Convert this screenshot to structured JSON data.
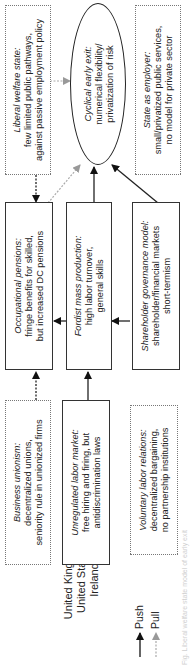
{
  "legend": {
    "countries": [
      "United Kingdom",
      "United States",
      "Ireland"
    ],
    "push_label": "Push",
    "pull_label": "Pull",
    "push_color": "#111111",
    "pull_color": "#999999"
  },
  "boxes": {
    "business_unionism": {
      "title": "Business unionism:",
      "lines": [
        "decentralized unions,",
        "seniority rule in unionized firms"
      ],
      "border": "dotted"
    },
    "unregulated_labor_market": {
      "title": "Unregulated labor market:",
      "lines": [
        "free hiring and firing, but",
        "antidiscrimination laws"
      ],
      "border": "solid"
    },
    "voluntary_labor_relations": {
      "title": "Voluntary labor relations:",
      "lines": [
        "decentralized bargaining,",
        "no partnership institutions"
      ],
      "border": "dotted"
    },
    "occupational_pensions": {
      "title": "Occupational pensions:",
      "lines": [
        "fringe benefits for skilled,",
        "but increased DC pensions"
      ],
      "border": "solid"
    },
    "fordist_mass_production": {
      "title": "Fordist mass production:",
      "lines": [
        "high labor turnover,",
        "general skills"
      ],
      "border": "solid"
    },
    "shareholder_governance": {
      "title": "Shareholder governance model:",
      "lines": [
        "shareholder/financial markets",
        "short-termism"
      ],
      "border": "solid"
    },
    "liberal_welfare_state": {
      "title": "Liberal welfare state:",
      "lines": [
        "few limited public pathways,",
        "against passive employment policy"
      ],
      "border": "dotted"
    },
    "state_as_employer": {
      "title": "State as employer:",
      "lines": [
        "small/privatized public services,",
        "no model for private sector"
      ],
      "border": "dotted"
    }
  },
  "outcome": {
    "title": "Cyclical early exit:",
    "lines": [
      "numerical flexibility/",
      "privatization of risk"
    ]
  },
  "caption": "Fig. Liberal welfare state model of early exit"
}
